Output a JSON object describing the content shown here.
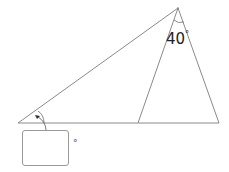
{
  "diagram": {
    "type": "triangle-angle-problem",
    "points": {
      "apex": [
        178,
        8
      ],
      "left_base": [
        18,
        123
      ],
      "mid_base": [
        138,
        123
      ],
      "right_base": [
        219,
        123
      ]
    },
    "given_angle": {
      "value": "40",
      "unit": "°",
      "at": "apex"
    },
    "unknown_angle": {
      "at": "left_base"
    },
    "stroke_color": "#8a8a8a"
  },
  "answer": {
    "value": "",
    "placeholder": "",
    "unit": "°"
  }
}
